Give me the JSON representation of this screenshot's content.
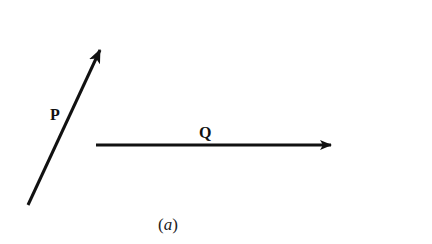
{
  "figure": {
    "caption_open": "(",
    "caption_letter": "a",
    "caption_close": ")",
    "stroke_color": "#111111",
    "background": "#ffffff"
  },
  "vectors": [
    {
      "name": "P",
      "label": "P",
      "tail": [
        28,
        205
      ],
      "head": [
        101,
        48
      ],
      "direction": "up-right"
    },
    {
      "name": "Q",
      "label": "Q",
      "tail": [
        96,
        145
      ],
      "head": [
        332,
        145
      ],
      "direction": "right"
    }
  ]
}
